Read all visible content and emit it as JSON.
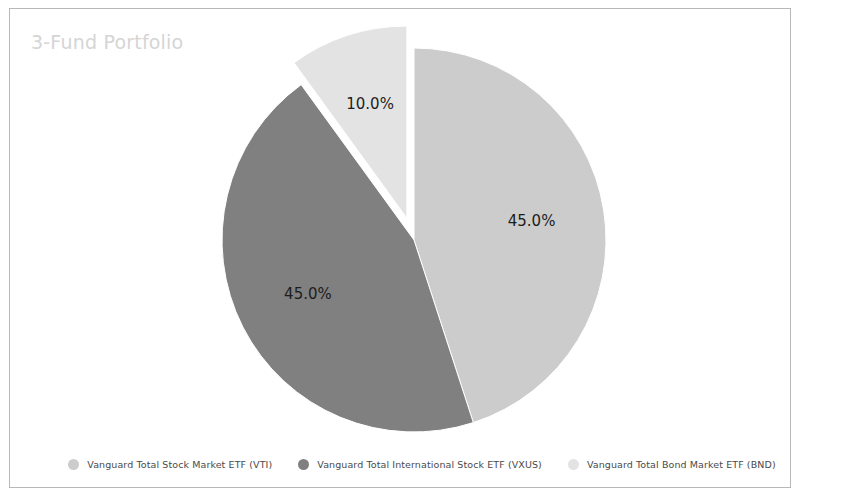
{
  "frame": {
    "border_color": "#b8b8b8",
    "background": "#ffffff"
  },
  "chart": {
    "title": "3-Fund Portfolio",
    "title_color": "#d5d5d5"
  },
  "chart_data": {
    "type": "pie",
    "title": "3-Fund Portfolio",
    "xlabel": "",
    "ylabel": "",
    "legend_position": "bottom",
    "grid": false,
    "start_angle": 90,
    "counterclock": false,
    "categories": [
      "Vanguard Total Stock Market ETF (VTI)",
      "Vanguard Total International Stock ETF (VXUS)",
      "Vanguard Total Bond Market ETF (BND)"
    ],
    "values": [
      45.0,
      45.0,
      10.0
    ],
    "labels": [
      "45.0%",
      "45.0%",
      "10.0%"
    ],
    "colors": [
      "#cccccc",
      "#808080",
      "#e3e3e3"
    ],
    "explode": [
      0.0,
      0.0,
      0.12
    ],
    "slices": [
      {
        "name": "Vanguard Total Stock Market ETF (VTI)",
        "value": 45.0,
        "label": "45.0%",
        "color": "#cccccc",
        "exploded": false
      },
      {
        "name": "Vanguard Total International Stock ETF (VXUS)",
        "value": 45.0,
        "label": "45.0%",
        "color": "#808080",
        "exploded": false
      },
      {
        "name": "Vanguard Total Bond Market ETF (BND)",
        "value": 10.0,
        "label": "10.0%",
        "color": "#e3e3e3",
        "exploded": true
      }
    ]
  },
  "legend": {
    "items": [
      {
        "label": "Vanguard Total Stock Market ETF (VTI)",
        "color": "#cccccc",
        "marker": "circle-marker"
      },
      {
        "label": "Vanguard Total International Stock ETF (VXUS)",
        "color": "#808080",
        "marker": "circle-marker"
      },
      {
        "label": "Vanguard Total Bond Market ETF (BND)",
        "color": "#e3e3e3",
        "marker": "circle-marker"
      }
    ]
  }
}
